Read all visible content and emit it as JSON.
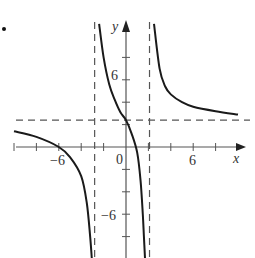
{
  "chart_data": {
    "type": "line",
    "title": "",
    "xlabel": "x",
    "ylabel": "y",
    "xlim": [
      -10.5,
      11
    ],
    "ylim": [
      -10,
      11
    ],
    "grid": false,
    "legend": null,
    "x_ticks": [
      -10,
      -8,
      -6,
      -4,
      -2,
      0,
      2,
      4,
      6,
      8
    ],
    "x_tick_labels": [
      {
        "value": -6,
        "label": "−6"
      },
      {
        "value": 0,
        "label": "0"
      },
      {
        "value": 6,
        "label": "6"
      }
    ],
    "y_ticks": [
      -8,
      -6,
      -4,
      -2,
      2,
      4,
      6,
      8
    ],
    "y_tick_labels": [
      {
        "value": 6,
        "label": "6"
      },
      {
        "value": -6,
        "label": "−6"
      }
    ],
    "asymptotes": {
      "vertical": [
        -2.8,
        2.1
      ],
      "horizontal": [
        2.4
      ],
      "style": "dashed"
    },
    "series": [
      {
        "name": "left branch",
        "points": [
          [
            -10,
            1.4
          ],
          [
            -8,
            0.9
          ],
          [
            -6,
            0
          ],
          [
            -5,
            -0.9
          ],
          [
            -4,
            -2.6
          ],
          [
            -3.5,
            -5
          ],
          [
            -3.2,
            -8
          ],
          [
            -3.05,
            -10
          ]
        ]
      },
      {
        "name": "middle branch",
        "points": [
          [
            -2.4,
            11
          ],
          [
            -2,
            8
          ],
          [
            -1.5,
            5.6
          ],
          [
            -1,
            4.2
          ],
          [
            -0.5,
            3.1
          ],
          [
            0,
            2.4
          ],
          [
            0.5,
            1.2
          ],
          [
            1,
            -0.5
          ],
          [
            1.3,
            -3
          ],
          [
            1.5,
            -6
          ],
          [
            1.6,
            -8
          ],
          [
            1.7,
            -10
          ]
        ]
      },
      {
        "name": "right branch",
        "points": [
          [
            2.5,
            11
          ],
          [
            3,
            7
          ],
          [
            3.5,
            5.4
          ],
          [
            4,
            4.7
          ],
          [
            5,
            4
          ],
          [
            6,
            3.6
          ],
          [
            8,
            3.2
          ],
          [
            10,
            2.9
          ]
        ]
      }
    ]
  },
  "labels": {
    "x_axis": "x",
    "y_axis": "y",
    "origin": "0",
    "x_neg6": "−6",
    "x_pos6": "6",
    "y_pos6": "6",
    "y_neg6": "−6"
  },
  "colors": {
    "curve": "#1a1a1a",
    "axis": "#555555",
    "dashed": "#555555"
  }
}
